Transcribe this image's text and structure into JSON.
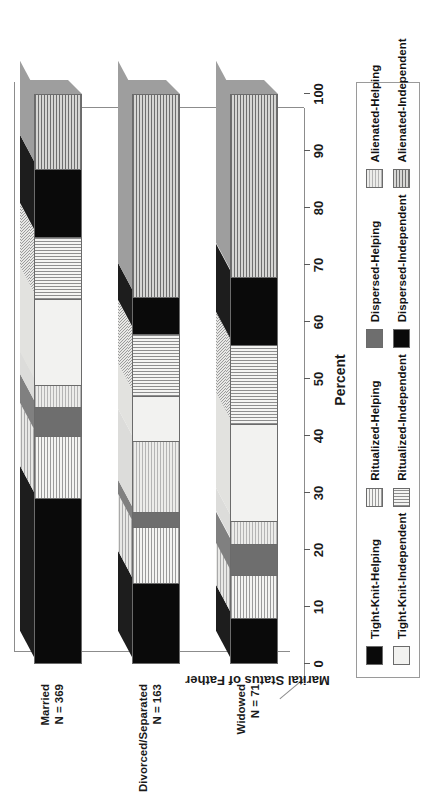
{
  "chart_data": {
    "type": "bar",
    "orientation": "horizontal",
    "stacked": true,
    "stack_total": 100,
    "title": "",
    "xlabel": "Percent",
    "ylabel": "Marital Status of Father",
    "xlim": [
      0,
      100
    ],
    "xticks": [
      "0",
      "10",
      "20",
      "30",
      "40",
      "50",
      "60",
      "70",
      "80",
      "90",
      "100"
    ],
    "grid": false,
    "legend_position": "bottom",
    "categories": [
      {
        "line1": "Married",
        "line2": "N = 369"
      },
      {
        "line1": "Divorced/Separated",
        "line2": "N = 163"
      },
      {
        "line1": "Widowed",
        "line2": "N = 71"
      }
    ],
    "series": [
      {
        "name": "Tight-Knit-Helping",
        "pattern": "solid-black",
        "values": [
          29.0,
          14.0,
          8.0
        ]
      },
      {
        "name": "Ritualized-Helping",
        "pattern": "horizontal-stripes",
        "values": [
          11.0,
          10.0,
          7.5
        ]
      },
      {
        "name": "Dispersed-Helping",
        "pattern": "solid-dark-gray",
        "values": [
          5.0,
          2.5,
          5.5
        ]
      },
      {
        "name": "Alienated-Helping",
        "pattern": "light-crosshatch",
        "values": [
          4.0,
          12.5,
          4.0
        ]
      },
      {
        "name": "Tight-Knit-Independent",
        "pattern": "solid-white",
        "values": [
          15.0,
          8.0,
          17.0
        ]
      },
      {
        "name": "Ritualized-Independent",
        "pattern": "vertical-stripes",
        "values": [
          11.0,
          11.0,
          14.0
        ]
      },
      {
        "name": "Dispersed-Independent",
        "pattern": "solid-black",
        "values": [
          12.0,
          6.5,
          12.0
        ]
      },
      {
        "name": "Alienated-Independent",
        "pattern": "dark-crosshatch",
        "values": [
          13.0,
          35.5,
          32.0
        ]
      }
    ],
    "legend": [
      "Tight-Knit-Helping",
      "Ritualized-Helping",
      "Dispersed-Helping",
      "Alienated-Helping",
      "Tight-Knit-Independent",
      "Ritualized-Independent",
      "Dispersed-Independent",
      "Alienated-Independent"
    ],
    "colors": {
      "solid_black": "#0a0a0a",
      "solid_white": "#f2f2f0",
      "dark_gray": "#6e6e6e",
      "stripe_gray": "#9b9b9b",
      "frame_gray": "#8c8c8c",
      "text": "#1a1a1a",
      "background": "#ffffff"
    }
  }
}
